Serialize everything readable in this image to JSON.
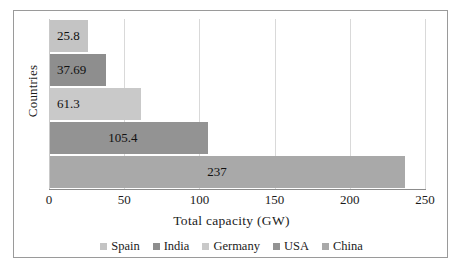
{
  "chart_data": {
    "type": "bar",
    "orientation": "horizontal",
    "title": "",
    "xlabel": "Total  capacity (GW)",
    "ylabel": "Countries",
    "categories": [
      "Spain",
      "India",
      "Germany",
      "USA",
      "China"
    ],
    "values": [
      25.8,
      37.69,
      61.3,
      105.4,
      237
    ],
    "value_labels": [
      "25.8",
      "37.69",
      "61.3",
      "105.4",
      "237"
    ],
    "xlim": [
      0,
      250
    ],
    "xticks": [
      0,
      50,
      100,
      150,
      200,
      250
    ],
    "xtick_labels": [
      "0",
      "50",
      "100",
      "150",
      "200",
      "250"
    ],
    "grid": true,
    "grid_axis": "x",
    "legend": {
      "position": "bottom",
      "entries": [
        {
          "label": "Spain",
          "color": "#c4c4c4"
        },
        {
          "label": "India",
          "color": "#8e8e8e"
        },
        {
          "label": "Germany",
          "color": "#c9c9c9"
        },
        {
          "label": "USA",
          "color": "#939393"
        },
        {
          "label": "China",
          "color": "#a9a9a9"
        }
      ]
    },
    "series": [
      {
        "name": "Spain",
        "value": 25.8,
        "color": "#c4c4c4"
      },
      {
        "name": "India",
        "value": 37.69,
        "color": "#8e8e8e"
      },
      {
        "name": "Germany",
        "value": 61.3,
        "color": "#c9c9c9"
      },
      {
        "name": "USA",
        "value": 105.4,
        "color": "#939393"
      },
      {
        "name": "China",
        "value": 237,
        "color": "#a9a9a9"
      }
    ]
  },
  "caption": ""
}
